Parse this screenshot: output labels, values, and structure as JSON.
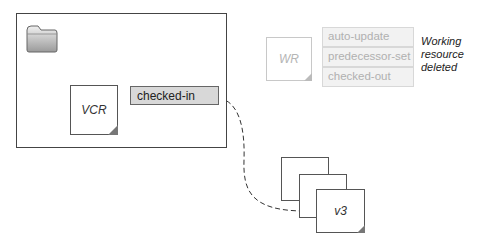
{
  "diagram": {
    "container": {
      "label": ""
    },
    "folder": {
      "icon": "folder-icon"
    },
    "vcr": {
      "label": "VCR"
    },
    "vcr_state": {
      "label": "checked-in"
    },
    "working_resource": {
      "label": "WR",
      "states": [
        "auto-update",
        "predecessor-set",
        "checked-out"
      ],
      "note_lines": [
        "Working",
        "resource",
        "deleted"
      ]
    },
    "versions": {
      "top_label": "v3",
      "count": 3
    },
    "colors": {
      "border": "#444444",
      "state_fill": "#d8d8d8",
      "ghost_fill": "#f2f2f2",
      "ghost_text": "#b0b0b0"
    }
  }
}
